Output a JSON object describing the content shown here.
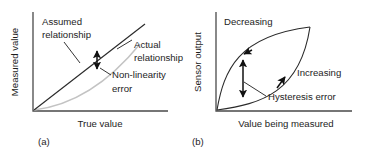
{
  "figure": {
    "background_color": "#ffffff",
    "ink_color": "#1d1d1d",
    "faint_curve_color": "#c3c3c3",
    "panels": [
      {
        "id": "a",
        "caption": "(a)",
        "topic": "Non-linearity error",
        "axes": {
          "x_label": "True value",
          "y_label": "Measured value",
          "origin": [
            33,
            111
          ],
          "x_end": [
            168,
            111
          ],
          "y_top": [
            33,
            12
          ]
        },
        "annotations": [
          {
            "name": "assumed-relationship",
            "text_lines": [
              "Assumed",
              "relationship"
            ],
            "text_anchor": [
              42,
              24
            ],
            "leader_from": [
              64,
              41
            ],
            "leader_to": [
              79,
              62
            ]
          },
          {
            "name": "actual-relationship",
            "text_lines": [
              "Actual",
              "relationship"
            ],
            "text_anchor": [
              118,
              52
            ],
            "leader_from": [
              117,
              49
            ],
            "leader_to": [
              131,
              41
            ]
          },
          {
            "name": "non-linearity-error",
            "text_lines": [
              "Non-linearity",
              "error"
            ],
            "text_anchor": [
              112,
              78
            ],
            "leader_from": [
              110,
              75
            ],
            "leader_to": [
              99,
              68
            ]
          }
        ],
        "curves": [
          {
            "name": "assumed-straight-line",
            "style": "solid",
            "from": [
              34,
              110
            ],
            "to": [
              145,
              24
            ]
          },
          {
            "name": "actual-curved-line",
            "style": "faint",
            "from": [
              34,
              110
            ],
            "control": [
              90,
              104
            ],
            "to": [
              140,
              44
            ]
          }
        ],
        "error_arrow": {
          "name": "non-linearity-error-arrow",
          "x": 97,
          "y_top": 50,
          "y_bottom": 70,
          "double_headed": true
        }
      },
      {
        "id": "b",
        "caption": "(b)",
        "topic": "Hysteresis error",
        "axes": {
          "x_label": "Value being measured",
          "y_label": "Sensor output",
          "origin": [
            216,
            111
          ],
          "x_end": [
            352,
            111
          ],
          "y_top": [
            216,
            12
          ]
        },
        "annotations": [
          {
            "name": "decreasing-label",
            "text_lines": [
              "Decreasing"
            ],
            "text_anchor": [
              224,
              24
            ]
          },
          {
            "name": "increasing-label",
            "text_lines": [
              "Increasing"
            ],
            "text_anchor": [
              297,
              74
            ]
          },
          {
            "name": "hysteresis-error-label",
            "text_lines": [
              "Hysteresis error"
            ],
            "text_anchor": [
              268,
              99
            ],
            "leader_from": [
              266,
              96
            ],
            "leader_to": [
              243,
              82
            ]
          }
        ],
        "curves": [
          {
            "name": "decreasing-branch",
            "style": "solid",
            "from": [
              217,
              110
            ],
            "control": [
              232,
              36
            ],
            "to": [
              310,
              27
            ]
          },
          {
            "name": "increasing-branch",
            "style": "solid",
            "from": [
              217,
              110
            ],
            "control": [
              290,
              100
            ],
            "to": [
              310,
              27
            ]
          }
        ],
        "direction_arrows": [
          {
            "name": "decreasing-arrow-upper",
            "x": 243,
            "y": 55,
            "angle": 35
          },
          {
            "name": "increasing-arrow-lower",
            "x": 282,
            "y": 80,
            "angle": -40
          }
        ],
        "error_arrow": {
          "name": "hysteresis-error-arrow",
          "x": 243,
          "y_top": 58,
          "y_bottom": 98,
          "double_headed": true
        }
      }
    ]
  }
}
